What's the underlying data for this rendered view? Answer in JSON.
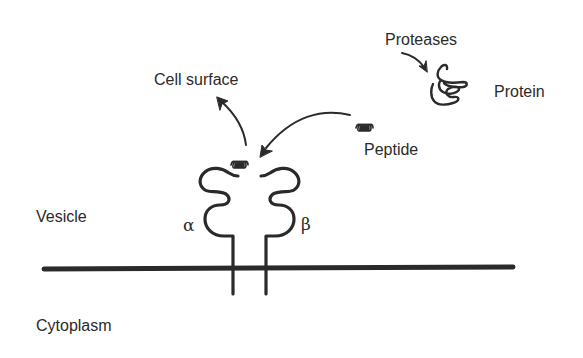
{
  "diagram": {
    "type": "biological-schematic",
    "labels": {
      "cell_surface": "Cell surface",
      "proteases": "Proteases",
      "protein": "Protein",
      "peptide": "Peptide",
      "vesicle": "Vesicle",
      "cytoplasm": "Cytoplasm",
      "alpha_chain": "α",
      "beta_chain": "β"
    },
    "elements": [
      {
        "id": "membrane",
        "kind": "line",
        "description": "vesicle membrane"
      },
      {
        "id": "alpha-chain",
        "kind": "receptor-chain",
        "label": "α"
      },
      {
        "id": "beta-chain",
        "kind": "receptor-chain",
        "label": "β"
      },
      {
        "id": "bound-peptide",
        "kind": "coil",
        "description": "peptide in binding groove"
      },
      {
        "id": "free-peptide",
        "kind": "coil",
        "description": "peptide"
      },
      {
        "id": "protein",
        "kind": "folded-chain",
        "description": "protein"
      }
    ],
    "arrows": [
      {
        "from": "proteases",
        "to": "protein"
      },
      {
        "from": "free-peptide",
        "to": "bound-peptide"
      },
      {
        "from": "bound-peptide",
        "to": "cell_surface"
      }
    ],
    "colors": {
      "ink": "#2a2a2a",
      "background": "#ffffff"
    }
  }
}
